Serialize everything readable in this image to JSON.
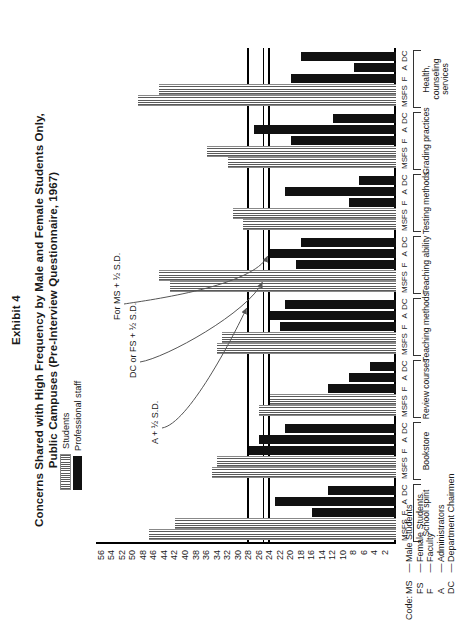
{
  "exhibit_label": "Exhibit 4",
  "title_line1": "Concerns Shared with High Frequency by Male and Female Students Only,",
  "title_line2": "Public Campuses (Pre-Interview Questionnaire, 1967)",
  "legend": {
    "items": [
      {
        "label": "Students",
        "pattern": "hatched",
        "color": "#5a5a5a"
      },
      {
        "label": "Professional staff",
        "pattern": "solid",
        "color": "#111111"
      }
    ]
  },
  "code_key": {
    "heading": "Code:",
    "rows": [
      {
        "abbr": "MS",
        "dash": "—",
        "meaning": "Male Students"
      },
      {
        "abbr": "FS",
        "dash": "—",
        "meaning": "Female Students"
      },
      {
        "abbr": "F",
        "dash": "—",
        "meaning": "Faculty"
      },
      {
        "abbr": "A",
        "dash": "—",
        "meaning": "Administrators"
      },
      {
        "abbr": "DC",
        "dash": "—",
        "meaning": "Department Chairmen"
      }
    ]
  },
  "annotations": [
    {
      "id": "a-half-sd",
      "text": "A + ½  S.D.",
      "value": 28
    },
    {
      "id": "dc-fs-half-sd",
      "text": "DC or FS + ½ S.D.",
      "value": 25
    },
    {
      "id": "ms-half-sd",
      "text": "For MS + ½ S.D.",
      "value": 24
    }
  ],
  "chart_data": {
    "type": "bar",
    "title": "Concerns Shared with High Frequency by Male and Female Students Only, Public Campuses (Pre-Interview Questionnaire, 1967)",
    "xlabel": "",
    "ylabel": "",
    "ylim": [
      0,
      57
    ],
    "ytick_values": [
      2,
      4,
      6,
      8,
      10,
      12,
      14,
      16,
      18,
      20,
      22,
      24,
      26,
      28,
      30,
      32,
      34,
      36,
      38,
      40,
      42,
      44,
      46,
      48,
      50,
      52,
      54,
      56
    ],
    "grid": false,
    "legend_position": "top-left",
    "respondent_codes": [
      "MS",
      "FS",
      "F",
      "A",
      "DC"
    ],
    "respondent_types": [
      "students",
      "students",
      "staff",
      "staff",
      "staff"
    ],
    "reference_lines": [
      {
        "label": "A + ½  S.D.",
        "value": 28
      },
      {
        "label": "DC or FS + ½ S.D.",
        "value": 25
      },
      {
        "label": "For MS + ½ S.D.",
        "value": 24
      }
    ],
    "categories": [
      "School spirit",
      "Bookstore",
      "Review courses",
      "Teaching methods",
      "Teaching ability",
      "Testing methods",
      "Grading practices",
      "Health, counseling services"
    ],
    "series": [
      {
        "name": "MS",
        "values": [
          47,
          35,
          26,
          34,
          43,
          29,
          32,
          49
        ]
      },
      {
        "name": "FS",
        "values": [
          42,
          34,
          24,
          33,
          45,
          31,
          36,
          45
        ]
      },
      {
        "name": "F",
        "values": [
          16,
          28,
          13,
          22,
          19,
          9,
          20,
          20
        ]
      },
      {
        "name": "A",
        "values": [
          23,
          26,
          9,
          24,
          24,
          21,
          27,
          8
        ]
      },
      {
        "name": "DC",
        "values": [
          13,
          21,
          5,
          21,
          18,
          7,
          12,
          18
        ]
      }
    ]
  }
}
